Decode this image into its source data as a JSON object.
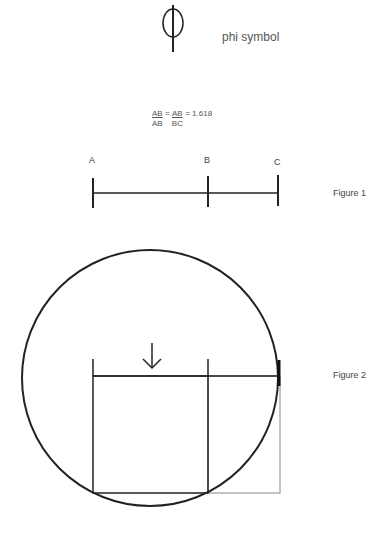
{
  "phi": {
    "glyph": "phi-symbol-icon",
    "label": "phi symbol"
  },
  "formula": {
    "frac1_num": "AB",
    "frac1_den": "AB",
    "equals1": "=",
    "frac2_num": "AB",
    "frac2_den": "BC",
    "equals2": "=",
    "value": "1.618"
  },
  "figure1": {
    "caption": "Figure 1",
    "points": [
      {
        "label": "A",
        "x": 93
      },
      {
        "label": "B",
        "x": 208
      },
      {
        "label": "C",
        "x": 278
      }
    ],
    "line_y": 193
  },
  "figure2": {
    "caption": "Figure 2",
    "circle": {
      "cx": 150,
      "cy": 378,
      "r": 128
    },
    "square": {
      "x": 93,
      "y": 376,
      "width": 115,
      "height": 117
    },
    "extension_rect": {
      "x": 208,
      "y": 376,
      "width": 72,
      "height": 117
    },
    "arrow": {
      "x": 152,
      "y1": 343,
      "y2": 368,
      "direction": "down"
    }
  },
  "colors": {
    "stroke": "#222222",
    "thin_stroke": "#888888",
    "text": "#444444"
  }
}
